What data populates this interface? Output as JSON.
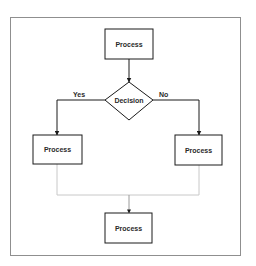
{
  "diagram": {
    "type": "flowchart",
    "colors": {
      "frame": "#8f8f8f",
      "stroke": "#1a1a1a",
      "light_connector": "#c8c8c8",
      "text": "#2a2a2a"
    },
    "nodes": [
      {
        "id": "process-top",
        "shape": "rectangle",
        "label": "Process"
      },
      {
        "id": "decision",
        "shape": "diamond",
        "label": "Decision"
      },
      {
        "id": "process-left",
        "shape": "rectangle",
        "label": "Process"
      },
      {
        "id": "process-right",
        "shape": "rectangle",
        "label": "Process"
      },
      {
        "id": "process-bottom",
        "shape": "rectangle",
        "label": "Process"
      }
    ],
    "edges": [
      {
        "from": "process-top",
        "to": "decision",
        "label": ""
      },
      {
        "from": "decision",
        "to": "process-left",
        "label": "Yes"
      },
      {
        "from": "decision",
        "to": "process-right",
        "label": "No"
      },
      {
        "from": "process-left",
        "to": "process-bottom",
        "label": ""
      },
      {
        "from": "process-right",
        "to": "process-bottom",
        "label": ""
      }
    ],
    "edge_labels": {
      "yes": "Yes",
      "no": "No"
    }
  }
}
